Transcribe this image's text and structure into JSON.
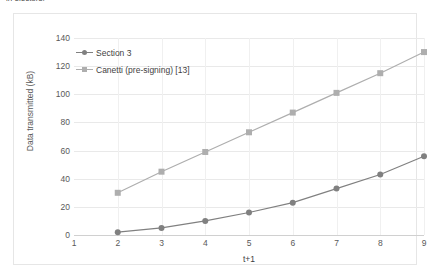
{
  "figure": {
    "top_text_sliver": "in electors.",
    "background_color": "#ffffff",
    "frame_color": "#e6e6e6"
  },
  "chart_data": {
    "type": "line",
    "title": "",
    "subtitle": "",
    "xlabel": "t+1",
    "ylabel": "Data transmitted (kB)",
    "x": [
      2,
      3,
      4,
      5,
      6,
      7,
      8,
      9
    ],
    "xlim": [
      1,
      9
    ],
    "ylim": [
      0,
      140
    ],
    "xticks": [
      1,
      2,
      3,
      4,
      5,
      6,
      7,
      8,
      9
    ],
    "xtick_labels": [
      "1",
      "2",
      "3",
      "4",
      "5",
      "6",
      "7",
      "8",
      "9"
    ],
    "yticks": [
      0,
      20,
      40,
      60,
      80,
      100,
      120,
      140
    ],
    "ytick_labels": [
      "0",
      "20",
      "40",
      "60",
      "80",
      "100",
      "120",
      "140"
    ],
    "grid": "horizontal-and-vertical-faint",
    "legend_position": "inside-top-left",
    "series": [
      {
        "name": "Section 3",
        "values": [
          2,
          5,
          10,
          16,
          23,
          33,
          43,
          56
        ],
        "color": "#808080",
        "marker": "circle",
        "marker_size": 4.2,
        "line_width": 1.2
      },
      {
        "name": "Canetti (pre-signing) [13]",
        "values": [
          30,
          45,
          59,
          73,
          87,
          101,
          115,
          130
        ],
        "color": "#aeaeae",
        "marker": "square",
        "marker_size": 4.2,
        "line_width": 1.2
      }
    ]
  }
}
